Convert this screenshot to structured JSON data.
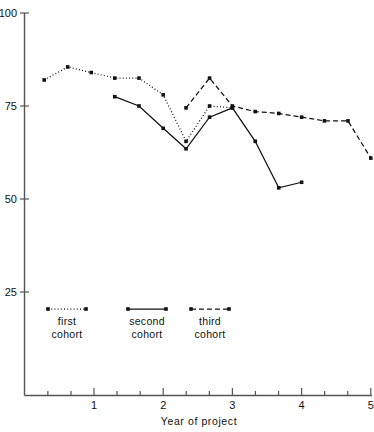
{
  "chart_data": {
    "type": "line",
    "title": "",
    "xlabel": "Year of project",
    "ylabel": "",
    "xlim": [
      0,
      5.15
    ],
    "ylim": [
      0,
      100
    ],
    "grid": false,
    "legend_position": "inside-bottom-left",
    "y_ticks": [
      25,
      50,
      75,
      100
    ],
    "y_tick_labels": [
      "25",
      "50",
      "75",
      "100"
    ],
    "x_ticks": [
      0.333,
      0.667,
      1,
      1.333,
      1.667,
      2,
      2.333,
      2.667,
      3,
      3.333,
      3.667,
      4,
      4.333,
      4.667,
      5
    ],
    "x_major_ticks": [
      1,
      2,
      3,
      4,
      5
    ],
    "x_tick_labels": [
      "1",
      "2",
      "3",
      "4",
      "5"
    ],
    "series": [
      {
        "name": "first cohort",
        "style": "dotted",
        "marker": "filled-square",
        "x": [
          0.28,
          0.62,
          0.96,
          1.3,
          1.65,
          2.0,
          2.33,
          2.67,
          3.0
        ],
        "y": [
          82.0,
          85.5,
          84.0,
          82.5,
          82.5,
          78.0,
          65.5,
          75.0,
          74.5
        ]
      },
      {
        "name": "second cohort",
        "style": "solid",
        "marker": "filled-square",
        "x": [
          1.3,
          1.65,
          2.0,
          2.33,
          2.67,
          3.0,
          3.33,
          3.67,
          4.0
        ],
        "y": [
          77.5,
          75.0,
          69.0,
          63.5,
          72.0,
          74.5,
          65.5,
          53.0,
          54.5
        ]
      },
      {
        "name": "third cohort",
        "style": "dashed",
        "marker": "filled-square",
        "x": [
          2.33,
          2.67,
          3.0,
          3.33,
          3.67,
          4.0,
          4.33,
          4.67,
          5.0
        ],
        "y": [
          74.5,
          82.5,
          75.0,
          73.5,
          73.0,
          72.0,
          71.0,
          71.0,
          61.0
        ]
      }
    ]
  },
  "axes": {
    "y_labels": [
      "100",
      "75",
      "50",
      "25"
    ],
    "x_labels": [
      "1",
      "2",
      "3",
      "4",
      "5"
    ],
    "x_title": "Year of project"
  },
  "legend": {
    "entries": [
      {
        "label_line1": "first",
        "label_line2": "cohort",
        "style": "dotted"
      },
      {
        "label_line1": "second",
        "label_line2": "cohort",
        "style": "solid"
      },
      {
        "label_line1": "third",
        "label_line2": "cohort",
        "style": "dashed"
      }
    ]
  },
  "colors": {
    "ink": "#111111",
    "axis": "#555555",
    "background": "#ffffff"
  }
}
